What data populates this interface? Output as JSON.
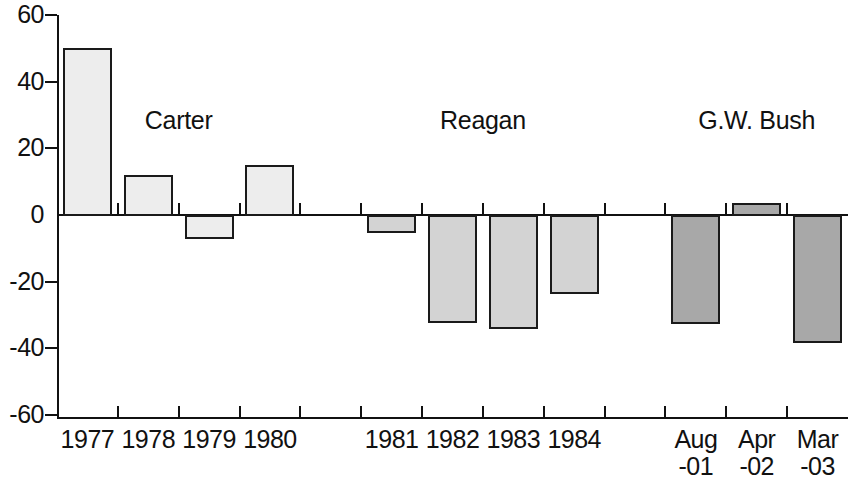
{
  "chart_data": {
    "type": "bar",
    "title": "",
    "subtitle": "",
    "xlabel": "",
    "ylabel": "",
    "ylim": [
      -60,
      60
    ],
    "yticks": [
      60,
      40,
      20,
      0,
      -20,
      -40,
      -60
    ],
    "ytick_labels": [
      "60",
      "40",
      "20",
      "0",
      "-20",
      "-40",
      "-60"
    ],
    "grid": false,
    "legend_position": "none",
    "categories": [
      "1977",
      "1978",
      "1979",
      "1980",
      "1981",
      "1982",
      "1983",
      "1984",
      "Aug -01",
      "Apr -02",
      "Mar -03"
    ],
    "values": [
      50,
      12,
      -7,
      15,
      -5,
      -32,
      -34,
      -23.5,
      -32.5,
      3.5,
      -38
    ],
    "groups": [
      {
        "name": "Carter",
        "fill": "#ededed",
        "bars": [
          {
            "label_line1": "1977",
            "label_line2": "",
            "value": 50
          },
          {
            "label_line1": "1978",
            "label_line2": "",
            "value": 12
          },
          {
            "label_line1": "1979",
            "label_line2": "",
            "value": -7
          },
          {
            "label_line1": "1980",
            "label_line2": "",
            "value": 15
          }
        ]
      },
      {
        "name": "Reagan",
        "fill": "#d3d3d3",
        "bars": [
          {
            "label_line1": "1981",
            "label_line2": "",
            "value": -5
          },
          {
            "label_line1": "1982",
            "label_line2": "",
            "value": -32
          },
          {
            "label_line1": "1983",
            "label_line2": "",
            "value": -34
          },
          {
            "label_line1": "1984",
            "label_line2": "",
            "value": -23.5
          }
        ]
      },
      {
        "name": "G.W. Bush",
        "fill": "#a8a8a8",
        "bars": [
          {
            "label_line1": "Aug",
            "label_line2": "-01",
            "value": -32.5
          },
          {
            "label_line1": "Apr",
            "label_line2": "-02",
            "value": 3.5
          },
          {
            "label_line1": "Mar",
            "label_line2": "-03",
            "value": -38
          }
        ]
      }
    ],
    "colors": {
      "axis": "#111111",
      "bar_outline": "#1a1a1a",
      "carter_fill": "#ededed",
      "reagan_fill": "#d3d3d3",
      "bush_fill": "#a8a8a8",
      "background": "#ffffff"
    }
  }
}
